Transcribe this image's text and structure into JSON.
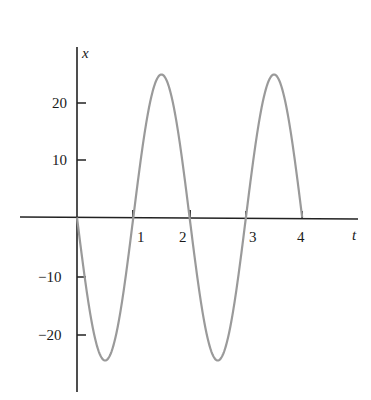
{
  "chart_data": {
    "type": "line",
    "title": "",
    "xlabel": "t",
    "ylabel": "x",
    "xlim": [
      0,
      5
    ],
    "ylim": [
      -30,
      30
    ],
    "x_ticks": [
      1,
      2,
      3,
      4
    ],
    "x_tick_labels": [
      "1",
      "2",
      "3",
      "4"
    ],
    "y_ticks": [
      -20,
      -10,
      10,
      20
    ],
    "y_tick_labels": [
      "−20",
      "−10",
      "10",
      "20"
    ],
    "grid": false,
    "legend": null,
    "series": [
      {
        "name": "x(t) = -25 sin(π t)",
        "x": [
          0,
          0.5,
          1,
          1.5,
          2,
          2.5,
          3,
          3.5,
          4
        ],
        "values": [
          0,
          -25,
          0,
          25,
          0,
          -25,
          0,
          25,
          0
        ],
        "color": "#9a9a9a"
      }
    ]
  },
  "labels": {
    "x_axis": "t",
    "y_axis": "x",
    "xt1": "1",
    "xt2": "2",
    "xt3": "3",
    "xt4": "4",
    "yt20": "20",
    "yt10": "10",
    "ytm10": "−10",
    "ytm20": "−20"
  }
}
